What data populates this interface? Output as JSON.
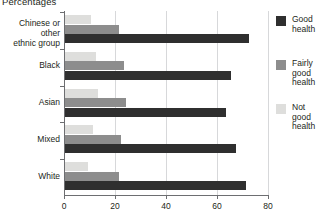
{
  "title": "Percentages",
  "legend": {
    "items": [
      {
        "key": "good",
        "label": "Good\nhealth"
      },
      {
        "key": "fairly",
        "label": "Fairly\ngood\nhealth"
      },
      {
        "key": "notgood",
        "label": "Not\ngood\nhealth"
      }
    ]
  },
  "axis": {
    "ticks": [
      "0",
      "20",
      "40",
      "60",
      "80"
    ]
  },
  "colors": {
    "good": "#2f2f2f",
    "fairly": "#8d8d8d",
    "notgood": "#dededc",
    "axis": "#6d6e71",
    "grid": "#d7d8da"
  },
  "chart_data": {
    "type": "bar",
    "orientation": "horizontal",
    "title": "Percentages",
    "xlabel": "",
    "ylabel": "",
    "xlim": [
      0,
      80
    ],
    "xticks": [
      0,
      20,
      40,
      60,
      80
    ],
    "grid": true,
    "legend_position": "right",
    "categories": [
      "Chinese or other ethnic group",
      "Black",
      "Asian",
      "Mixed",
      "White"
    ],
    "series": [
      {
        "name": "Good health",
        "values": [
          72,
          65,
          63,
          67,
          71
        ]
      },
      {
        "name": "Fairly good health",
        "values": [
          21,
          23,
          24,
          22,
          21
        ]
      },
      {
        "name": "Not good health",
        "values": [
          10,
          12,
          13,
          11,
          9
        ]
      }
    ]
  }
}
